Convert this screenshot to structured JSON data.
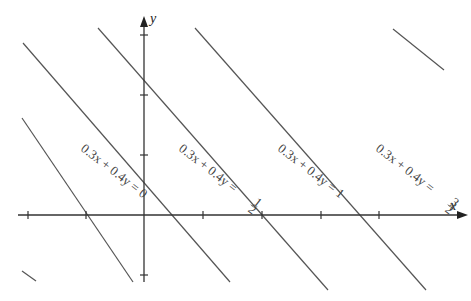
{
  "diagram": {
    "axes": {
      "x_label": "x",
      "y_label": "y",
      "origin_px": [
        144,
        215
      ],
      "x_tick_px": [
        28,
        86,
        203,
        262,
        321,
        379
      ],
      "y_tick_px": [
        35,
        95,
        155,
        275
      ]
    },
    "lines": [
      {
        "c": "-1/2",
        "x1": 22,
        "y1": 271,
        "x2": 36,
        "y2": 281
      },
      {
        "c": "0",
        "x1": 22,
        "y1": 118,
        "x2": 133,
        "y2": 282,
        "label": "0.3x + 0.4y = 0",
        "label_value": "0"
      },
      {
        "c": "1/2",
        "x1": 23,
        "y1": 43,
        "x2": 230,
        "y2": 282,
        "label": "0.3x + 0.4y = ",
        "label_value": "1/2"
      },
      {
        "c": "1",
        "x1": 98,
        "y1": 28,
        "x2": 328,
        "y2": 290,
        "label": "0.3x + 0.4y = 1",
        "label_value": "1"
      },
      {
        "c": "3/2",
        "x1": 195,
        "y1": 28,
        "x2": 426,
        "y2": 290,
        "label": "0.3x + 0.4y = ",
        "label_value": "3/2"
      },
      {
        "c": "2",
        "x1": 393,
        "y1": 29,
        "x2": 444,
        "y2": 70
      }
    ],
    "labels": [
      {
        "text": "0.3x + 0.4y = 0",
        "x": 80,
        "y": 150
      },
      {
        "text": "0.3x + 0.4y = ",
        "frac": "1/2",
        "x": 178,
        "y": 150
      },
      {
        "text": "0.3x + 0.4y = 1",
        "x": 277,
        "y": 150
      },
      {
        "text": "0.3x + 0.4y = ",
        "frac": "3/2",
        "x": 375,
        "y": 150
      }
    ]
  }
}
